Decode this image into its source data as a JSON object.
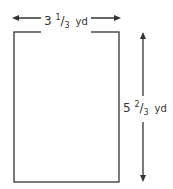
{
  "diagram": {
    "shape": "rectangle",
    "width_label": {
      "whole": "3",
      "num": "1",
      "den": "3",
      "unit": "yd"
    },
    "height_label": {
      "whole": "5",
      "num": "2",
      "den": "3",
      "unit": "yd"
    },
    "colors": {
      "stroke": "#333333",
      "background": "#ffffff"
    }
  }
}
